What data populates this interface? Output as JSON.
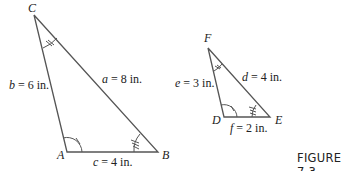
{
  "figure": {
    "caption": "FIGURE 7.3"
  },
  "triangle_abc": {
    "vertices": {
      "A": "A",
      "B": "B",
      "C": "C"
    },
    "sides": {
      "a": {
        "var": "a",
        "text": " = 8 in."
      },
      "b": {
        "var": "b",
        "text": " = 6 in."
      },
      "c": {
        "var": "c",
        "text": " = 4 in."
      }
    }
  },
  "triangle_def": {
    "vertices": {
      "D": "D",
      "E": "E",
      "F": "F"
    },
    "sides": {
      "d": {
        "var": "d",
        "text": " = 4 in."
      },
      "e": {
        "var": "e",
        "text": " = 3 in."
      },
      "f": {
        "var": "f",
        "text": " = 2 in."
      }
    }
  },
  "colors": {
    "line": "#555555",
    "text": "#222222"
  }
}
